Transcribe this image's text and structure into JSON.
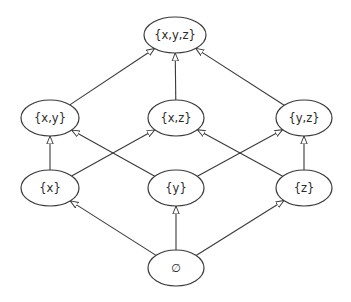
{
  "diagram": {
    "type": "hasse-diagram",
    "colors": {
      "stroke": "#3a3a3a",
      "fill": "#ffffff",
      "text": "#2a2a2a"
    },
    "nodes": [
      {
        "id": "xyz",
        "label": "{x,y,z}",
        "cx": 175,
        "cy": 35,
        "rx": 31,
        "ry": 18
      },
      {
        "id": "xy",
        "label": "{x,y}",
        "cx": 50,
        "cy": 118,
        "rx": 29,
        "ry": 18
      },
      {
        "id": "xz",
        "label": "{x,z}",
        "cx": 176,
        "cy": 118,
        "rx": 28,
        "ry": 18
      },
      {
        "id": "yz",
        "label": "{y,z}",
        "cx": 304,
        "cy": 118,
        "rx": 28,
        "ry": 18
      },
      {
        "id": "x",
        "label": "{x}",
        "cx": 50,
        "cy": 188,
        "rx": 29,
        "ry": 18
      },
      {
        "id": "y",
        "label": "{y}",
        "cx": 176,
        "cy": 188,
        "rx": 28,
        "ry": 18
      },
      {
        "id": "z",
        "label": "{z}",
        "cx": 304,
        "cy": 188,
        "rx": 28,
        "ry": 18
      },
      {
        "id": "empty",
        "label": "∅",
        "cx": 176,
        "cy": 268,
        "rx": 28,
        "ry": 18
      }
    ],
    "edges": [
      {
        "from": "empty",
        "to": "x"
      },
      {
        "from": "empty",
        "to": "y"
      },
      {
        "from": "empty",
        "to": "z"
      },
      {
        "from": "x",
        "to": "xy"
      },
      {
        "from": "x",
        "to": "xz"
      },
      {
        "from": "y",
        "to": "xy"
      },
      {
        "from": "y",
        "to": "yz"
      },
      {
        "from": "z",
        "to": "xz"
      },
      {
        "from": "z",
        "to": "yz"
      },
      {
        "from": "xy",
        "to": "xyz"
      },
      {
        "from": "xz",
        "to": "xyz"
      },
      {
        "from": "yz",
        "to": "xyz"
      }
    ],
    "arrowhead": "open-triangle"
  }
}
